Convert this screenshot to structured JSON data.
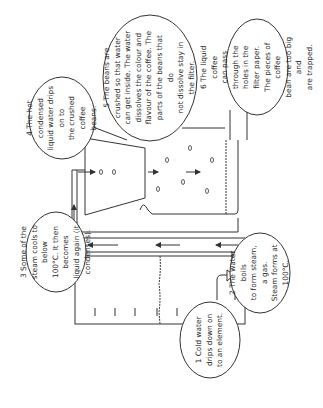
{
  "diagram": {
    "orientation": "rotated 90 degrees counter-clockwise",
    "line_color": "#333333",
    "background": "#ffffff",
    "callouts": [
      {
        "number": "1",
        "text": "1 Cold water\ndrips down on\nto an element."
      },
      {
        "number": "2",
        "text": "2  The water boils\nto form steam, a gas.\nSteam forms at\n100°C."
      },
      {
        "number": "3",
        "text": "3  Some of the\nsteam cools to below\n100°C. It then becomes\nliquid again (it\ncondenses)."
      },
      {
        "number": "4",
        "text": "4 The hot condensed\nliquid water drips on to\nthe crushed coffee\nbeans."
      },
      {
        "number": "5",
        "text": "5  The beans are\ncrushed so that water\ncan get inside. The water\ndissolves the colour and\nflavour of the coffee. The\nparts of the beans that do\nnot dissolve stay in\nthe filter."
      },
      {
        "number": "6",
        "text": "6  The liquid coffee\ncan pass through the\nholes in the filter paper.\nThe pieces of coffee\nbean are too big and\nare trapped."
      }
    ]
  }
}
